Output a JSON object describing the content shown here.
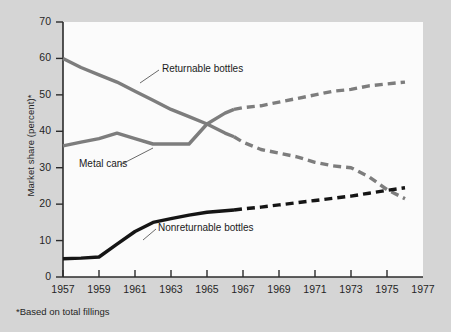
{
  "chart_data": {
    "type": "line",
    "title": "",
    "subtitle": "",
    "xlabel": "",
    "ylabel": "Market share (percent)*",
    "footnote": "*Based on total fillings",
    "xlim": [
      1957,
      1977
    ],
    "ylim": [
      0,
      70
    ],
    "grid": false,
    "legend_position": "inline-annotations",
    "x_tick_labels": [
      "1957",
      "1959",
      "1961",
      "1963",
      "1965",
      "1967",
      "1969",
      "1971",
      "1973",
      "1975",
      "1977"
    ],
    "x_ticks": [
      1957,
      1959,
      1961,
      1963,
      1965,
      1967,
      1969,
      1971,
      1973,
      1975,
      1977
    ],
    "y_tick_labels": [
      "0",
      "10",
      "20",
      "30",
      "40",
      "50",
      "60",
      "70"
    ],
    "y_ticks": [
      0,
      10,
      20,
      30,
      40,
      50,
      60,
      70
    ],
    "annotations": [
      {
        "label": "Returnable bottles",
        "x": 1962.4,
        "y": 55.0
      },
      {
        "label": "Metal cans",
        "x": 1958.3,
        "y": 30.6
      },
      {
        "label": "Nonreturnable bottles",
        "x": 1961.5,
        "y": 9.4
      }
    ],
    "series": [
      {
        "name": "Returnable bottles",
        "color": "#7d7d7d",
        "solid_until": 1966.5,
        "x": [
          1957,
          1958,
          1959,
          1960,
          1961,
          1962,
          1963,
          1964,
          1965,
          1966,
          1966.5,
          1967,
          1968,
          1969,
          1970,
          1971,
          1972,
          1973,
          1974,
          1975,
          1976
        ],
        "values": [
          60,
          57.5,
          55.5,
          53.5,
          51,
          48.5,
          46,
          44,
          42,
          39.5,
          38.5,
          37,
          35,
          34,
          33,
          31.5,
          30.5,
          30,
          27.5,
          24,
          21.5
        ]
      },
      {
        "name": "Metal cans",
        "color": "#7d7d7d",
        "solid_until": 1966.5,
        "x": [
          1957,
          1958,
          1959,
          1960,
          1961,
          1962,
          1963,
          1964,
          1965,
          1966,
          1966.5,
          1967,
          1968,
          1969,
          1970,
          1971,
          1972,
          1973,
          1974,
          1975,
          1976
        ],
        "values": [
          36,
          37,
          38,
          39.5,
          38,
          36.5,
          36.5,
          36.5,
          42,
          45,
          46,
          46.5,
          47,
          48,
          49,
          50,
          51,
          51.5,
          52.5,
          53,
          53.5
        ]
      },
      {
        "name": "Nonreturnable bottles",
        "color": "#151515",
        "solid_until": 1966.5,
        "x": [
          1957,
          1958,
          1959,
          1960,
          1961,
          1962,
          1963,
          1964,
          1965,
          1966,
          1966.5,
          1967,
          1968,
          1969,
          1970,
          1971,
          1972,
          1973,
          1974,
          1975,
          1976
        ],
        "values": [
          5,
          5.2,
          5.5,
          9,
          12.5,
          15,
          16,
          17,
          17.8,
          18.2,
          18.4,
          18.7,
          19.2,
          19.8,
          20.4,
          21,
          21.6,
          22.2,
          23,
          23.8,
          24.5
        ]
      }
    ]
  }
}
